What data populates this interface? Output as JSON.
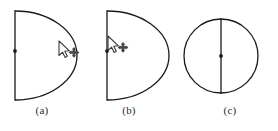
{
  "figure": {
    "background_color": "#ffffff",
    "stroke_color": "#1a1a1a",
    "caption_color": "#2b2b2b",
    "panels": [
      {
        "id": "a",
        "caption": "(a)",
        "shape": "half-disc",
        "description": "semicircle with vertical straight diameter edge on the left and arc bulging right",
        "diameter_line": {
          "x": 15,
          "y_top": 11,
          "y_bottom": 100
        },
        "arc": {
          "center_x": 15,
          "center_y": 55.5,
          "radius_x": 62,
          "radius_y": 44.5
        },
        "midpoint_dot": {
          "x": 15,
          "y": 51,
          "visible": true
        },
        "cursor": {
          "icon": "mouse-pointer-move-icon",
          "x": 59,
          "y": 44,
          "location_hint": "on the curved arc edge"
        }
      },
      {
        "id": "b",
        "caption": "(b)",
        "shape": "half-disc",
        "description": "semicircle with vertical straight diameter edge on the left and arc bulging right",
        "diameter_line": {
          "x": 15,
          "y_top": 11,
          "y_bottom": 100
        },
        "arc": {
          "center_x": 15,
          "center_y": 55.5,
          "radius_x": 62,
          "radius_y": 44.5
        },
        "midpoint_dot": {
          "x": 15,
          "y": 51,
          "visible": true
        },
        "cursor": {
          "icon": "mouse-pointer-move-icon",
          "x": 16,
          "y": 40,
          "location_hint": "at the midpoint of the straight diameter edge"
        }
      },
      {
        "id": "c",
        "caption": "(c)",
        "shape": "full-circle",
        "description": "full circle with a vertical diameter line through its center",
        "circle": {
          "center_x": 43,
          "center_y": 56,
          "radius": 37
        },
        "diameter_line": {
          "x": 43,
          "y_top": 19,
          "y_bottom": 93
        },
        "midpoint_dot": {
          "x": 43,
          "y": 56,
          "visible": true
        },
        "cursor": {
          "icon": "none",
          "visible": false
        }
      }
    ]
  }
}
